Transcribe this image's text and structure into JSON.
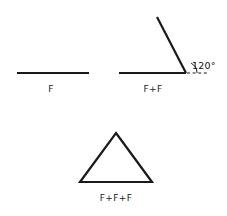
{
  "figure": {
    "background_color": "#ffffff",
    "stroke_color": "#1a1a1a",
    "text_color": "#222222",
    "stroke_width": 2.2,
    "panels": [
      {
        "id": "single-segment",
        "label": "F",
        "label_x": 51,
        "label_y": 92,
        "segments": [
          {
            "x1": 17,
            "y1": 73,
            "x2": 89,
            "y2": 73
          }
        ]
      },
      {
        "id": "two-segments-angle",
        "label": "F+F",
        "label_x": 153,
        "label_y": 92,
        "segments": [
          {
            "x1": 119,
            "y1": 73,
            "x2": 186,
            "y2": 73
          },
          {
            "x1": 186,
            "y1": 73,
            "x2": 157,
            "y2": 17
          }
        ],
        "dashed_extension": {
          "x1": 187,
          "y1": 73,
          "x2": 209,
          "y2": 73
        },
        "angle_arc": {
          "cx": 186,
          "cy": 73,
          "r": 11,
          "start_deg": 0,
          "end_deg": 62
        },
        "angle_label": "120°",
        "angle_label_x": 192,
        "angle_label_y": 69
      },
      {
        "id": "triangle",
        "label": "F+F+F",
        "label_x": 116,
        "label_y": 201,
        "vertices": [
          {
            "x": 116,
            "y": 133
          },
          {
            "x": 152,
            "y": 182
          },
          {
            "x": 80,
            "y": 182
          }
        ]
      }
    ]
  }
}
